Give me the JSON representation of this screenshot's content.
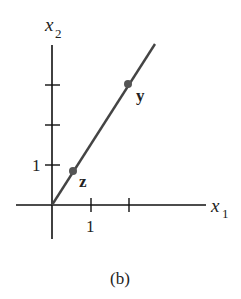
{
  "figure": {
    "caption": "(b)",
    "axes": {
      "x_label": "x",
      "x_subscript": "1",
      "y_label": "x",
      "y_subscript": "2",
      "x_tick_label": "1",
      "y_tick_label": "1"
    },
    "points": [
      {
        "name": "z",
        "label": "z",
        "x": 0.5,
        "y": 1
      },
      {
        "name": "y",
        "label": "y",
        "x": 2,
        "y": 3
      }
    ],
    "line": {
      "description": "line through origin spanned by z, containing y"
    },
    "colors": {
      "axis": "#111111",
      "line": "#444444",
      "point": "#555555",
      "text": "#222222"
    }
  }
}
